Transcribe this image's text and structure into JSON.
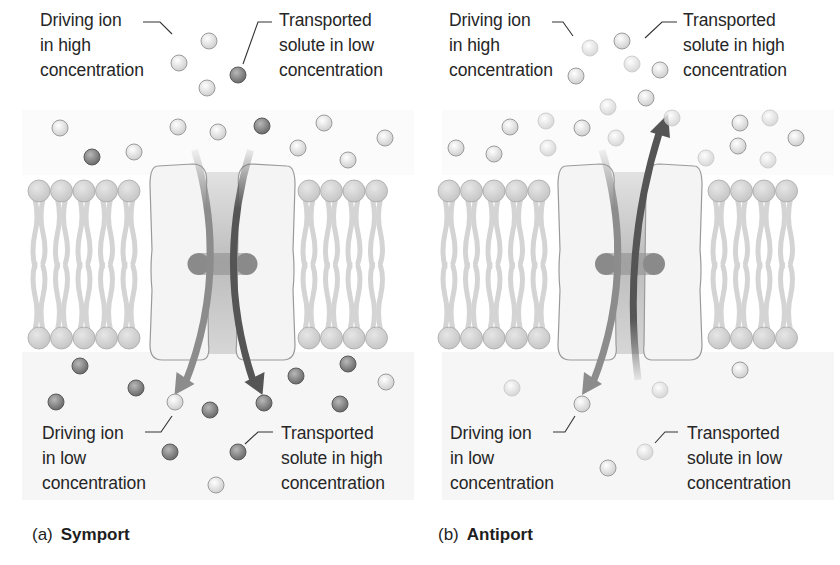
{
  "colors": {
    "background": "#ffffff",
    "fluid_background": "#f6f6f6",
    "phospholipid_head": "#c6c6c6",
    "phospholipid_tail": "#d4d4d4",
    "protein_fill": "#f4f4f4",
    "protein_outline": "#9a9a9a",
    "channel": "#bdbdbd",
    "binding_site": "#8a8a8a",
    "driving_ion_arrow": "#8c8c8c",
    "solute_arrow": "#555555",
    "driving_ion": "#e2e2e2",
    "solute_dark": "#7a7a7a",
    "solute_light": "#ececec",
    "text": "#262626"
  },
  "panels": [
    {
      "id": "symport",
      "caption": {
        "tag": "(a)",
        "name": "Symport"
      },
      "labels": {
        "top_left": "Driving ion\nin high\nconcentration",
        "top_right": "Transported\nsolute in low\nconcentration",
        "bottom_left": "Driving ion\nin low\nconcentration",
        "bottom_right": "Transported\nsolute in high\nconcentration"
      },
      "arrows": {
        "driving_ion": "down",
        "solute": "down"
      },
      "ions": {
        "driving": [
          [
            209,
            41
          ],
          [
            179,
            63
          ],
          [
            207,
            88
          ],
          [
            60,
            128
          ],
          [
            178,
            127
          ],
          [
            218,
            132
          ],
          [
            134,
            152
          ],
          [
            324,
            123
          ],
          [
            385,
            138
          ],
          [
            298,
            148
          ],
          [
            348,
            160
          ],
          [
            175,
            402
          ],
          [
            386,
            382
          ],
          [
            216,
            485
          ]
        ],
        "solute": [
          [
            238,
            75
          ],
          [
            92,
            157
          ],
          [
            262,
            126
          ],
          [
            80,
            366
          ],
          [
            136,
            388
          ],
          [
            56,
            402
          ],
          [
            210,
            410
          ],
          [
            264,
            403
          ],
          [
            296,
            376
          ],
          [
            348,
            364
          ],
          [
            340,
            404
          ],
          [
            170,
            452
          ],
          [
            238,
            452
          ]
        ]
      }
    },
    {
      "id": "antiport",
      "caption": {
        "tag": "(b)",
        "name": "Antiport"
      },
      "labels": {
        "top_left": "Driving ion\nin high\nconcentration",
        "top_right": "Transported\nsolute in high\nconcentration",
        "bottom_left": "Driving ion\nin low\nconcentration",
        "bottom_right": "Transported\nsolute in low\nconcentration"
      },
      "arrows": {
        "driving_ion": "down",
        "solute": "up"
      },
      "ions": {
        "driving": [
          [
            622,
            41
          ],
          [
            576,
            76
          ],
          [
            660,
            70
          ],
          [
            646,
            98
          ],
          [
            510,
            127
          ],
          [
            582,
            128
          ],
          [
            456,
            148
          ],
          [
            494,
            154
          ],
          [
            740,
            123
          ],
          [
            738,
            146
          ],
          [
            796,
            138
          ],
          [
            740,
            370
          ],
          [
            582,
            404
          ],
          [
            608,
            468
          ]
        ],
        "solute": [
          [
            590,
            48
          ],
          [
            632,
            64
          ],
          [
            608,
            107
          ],
          [
            546,
            121
          ],
          [
            548,
            148
          ],
          [
            672,
            118
          ],
          [
            616,
            138
          ],
          [
            770,
            118
          ],
          [
            768,
            160
          ],
          [
            706,
            158
          ],
          [
            512,
            388
          ],
          [
            660,
            390
          ],
          [
            645,
            452
          ]
        ]
      }
    }
  ]
}
